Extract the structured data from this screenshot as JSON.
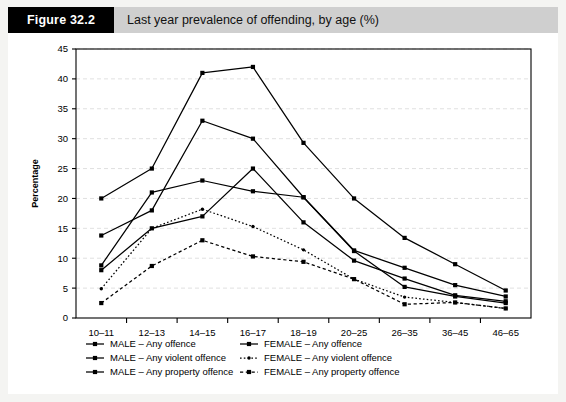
{
  "header": {
    "figure_tag": "Figure 32.2",
    "caption": "Last year prevalence of offending, by age (%)"
  },
  "chart_data": {
    "type": "line",
    "title": "Last year prevalence of offending, by age (%)",
    "xlabel": "",
    "ylabel": "Percentage",
    "categories": [
      "10–11",
      "12–13",
      "14–15",
      "16–17",
      "18–19",
      "20–25",
      "26–35",
      "36–45",
      "46–65"
    ],
    "ylim": [
      0,
      45
    ],
    "ytick_step": 5,
    "yticks": [
      0,
      5,
      10,
      15,
      20,
      25,
      30,
      35,
      40,
      45
    ],
    "grid": true,
    "legend_position": "below-axes",
    "series": [
      {
        "name": "MALE – Any offence",
        "style": "solid",
        "marker": "square",
        "color": "#000000",
        "values": [
          20,
          25,
          41,
          42,
          29.3,
          20,
          13.4,
          9,
          4.6
        ]
      },
      {
        "name": "MALE – Any violent offence",
        "style": "solid",
        "marker": "square",
        "color": "#000000",
        "values": [
          13.8,
          18,
          33,
          30,
          20.2,
          11.2,
          5.2,
          3.6,
          2.5
        ]
      },
      {
        "name": "MALE – Any property offence",
        "style": "solid",
        "marker": "square",
        "color": "#000000",
        "values": [
          8.8,
          21,
          23,
          21.2,
          20.2,
          11.3,
          8.4,
          5.5,
          3.6
        ]
      },
      {
        "name": "FEMALE – Any offence",
        "style": "solid",
        "marker": "square",
        "color": "#000000",
        "values": [
          8,
          15,
          17,
          25,
          16,
          9.6,
          6.6,
          3.8,
          2.8
        ]
      },
      {
        "name": "FEMALE – Any violent offence",
        "style": "dotted",
        "marker": "dot",
        "color": "#000000",
        "values": [
          4.9,
          15,
          18.2,
          15.3,
          11.4,
          6.5,
          3.5,
          2.6,
          1.6
        ]
      },
      {
        "name": "FEMALE – Any property offence",
        "style": "dashed",
        "marker": "square",
        "color": "#000000",
        "values": [
          2.5,
          8.7,
          13,
          10.3,
          9.4,
          6.5,
          2.3,
          2.6,
          1.6
        ]
      }
    ]
  },
  "legend": {
    "entries": [
      {
        "label": "MALE – Any offence",
        "col": 0
      },
      {
        "label": "MALE – Any violent offence",
        "col": 0
      },
      {
        "label": "MALE – Any property offence",
        "col": 0
      },
      {
        "label": "FEMALE – Any offence",
        "col": 1
      },
      {
        "label": "FEMALE – Any violent offence",
        "col": 1
      },
      {
        "label": "FEMALE – Any property offence",
        "col": 1
      }
    ]
  }
}
